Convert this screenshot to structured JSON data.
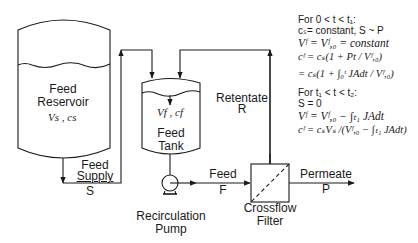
{
  "diagram": {
    "type": "process-flow",
    "line_color": "#1a1a1a",
    "components": {
      "feed_reservoir": {
        "label_line1": "Feed",
        "label_line2": "Reservoir",
        "vars": "Vs , cs"
      },
      "feed_tank": {
        "vars": "Vf , cf",
        "label_line1": "Feed",
        "label_line2": "Tank"
      },
      "pump": {
        "label_line1": "Recirculation",
        "label_line2": "Pump"
      },
      "filter": {
        "label_line1": "Crossflow",
        "label_line2": "Filter"
      }
    },
    "streams": {
      "feed_supply": {
        "label_line1": "Feed",
        "label_line2": "Supply",
        "symbol": "S"
      },
      "feed": {
        "label": "Feed",
        "symbol": "F"
      },
      "retentate": {
        "label": "Retentate",
        "symbol": "R"
      },
      "permeate": {
        "label": "Permeate",
        "symbol": "P"
      }
    },
    "equations": {
      "phase1": {
        "heading": "For 0 < t < t₁:",
        "condition": "cₛ= constant, S ~ P",
        "eq1": "Vᶠ = Vᶠ,₀ = constant",
        "eq2": "cᶠ = cₛ(1 + Pt / Vᶠ,₀)",
        "eq3": "= cₛ(1 + ∫₀ᵗ JAdt / Vᶠ,₀)"
      },
      "phase2": {
        "heading": "For t₁ < t < t₂:",
        "condition": "S = 0",
        "eq1": "Vᶠ = Vᶠ,₀ − ∫ₜ₁ JAdt",
        "eq2": "cᶠ = cₛVₛ /(Vᶠ,₀ − ∫ₜ₁ JAdt)"
      }
    }
  }
}
